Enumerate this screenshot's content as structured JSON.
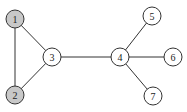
{
  "graph": {
    "nodes": [
      {
        "id": "1",
        "label": "1",
        "x": 15,
        "y": 19,
        "fill": "#c8c8c8"
      },
      {
        "id": "2",
        "label": "2",
        "x": 15,
        "y": 95,
        "fill": "#c8c8c8"
      },
      {
        "id": "3",
        "label": "3",
        "x": 52,
        "y": 57,
        "fill": "#ffffff"
      },
      {
        "id": "4",
        "label": "4",
        "x": 120,
        "y": 57,
        "fill": "#ffffff"
      },
      {
        "id": "5",
        "label": "5",
        "x": 152,
        "y": 16,
        "fill": "#ffffff"
      },
      {
        "id": "6",
        "label": "6",
        "x": 173,
        "y": 57,
        "fill": "#ffffff"
      },
      {
        "id": "7",
        "label": "7",
        "x": 153,
        "y": 96,
        "fill": "#ffffff"
      }
    ],
    "edges": [
      [
        "1",
        "2"
      ],
      [
        "1",
        "3"
      ],
      [
        "2",
        "3"
      ],
      [
        "3",
        "4"
      ],
      [
        "4",
        "5"
      ],
      [
        "4",
        "6"
      ],
      [
        "4",
        "7"
      ]
    ]
  }
}
